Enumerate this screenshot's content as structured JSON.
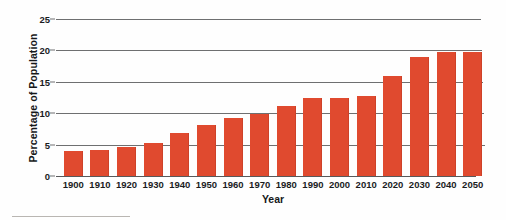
{
  "chart_data": {
    "type": "bar",
    "title": "",
    "xlabel": "Year",
    "ylabel": "Percentage of Population",
    "categories": [
      "1900",
      "1910",
      "1920",
      "1930",
      "1940",
      "1950",
      "1960",
      "1970",
      "1980",
      "1990",
      "2000",
      "2010",
      "2020",
      "2030",
      "2040",
      "2050"
    ],
    "values": [
      4.0,
      4.2,
      4.6,
      5.3,
      6.8,
      8.1,
      9.2,
      9.9,
      11.2,
      12.4,
      12.5,
      12.8,
      15.9,
      19.0,
      19.8,
      19.8
    ],
    "ylim": [
      0,
      25
    ],
    "yticks": [
      0,
      5,
      10,
      15,
      20,
      25
    ],
    "ytick_labels": [
      "0",
      "5",
      "10",
      "15",
      "20",
      "25"
    ],
    "grid": true,
    "legend": false,
    "bar_color": "#e04a2f",
    "gridline_color": "#6e6f70",
    "text_color": "#1a1c1e"
  }
}
